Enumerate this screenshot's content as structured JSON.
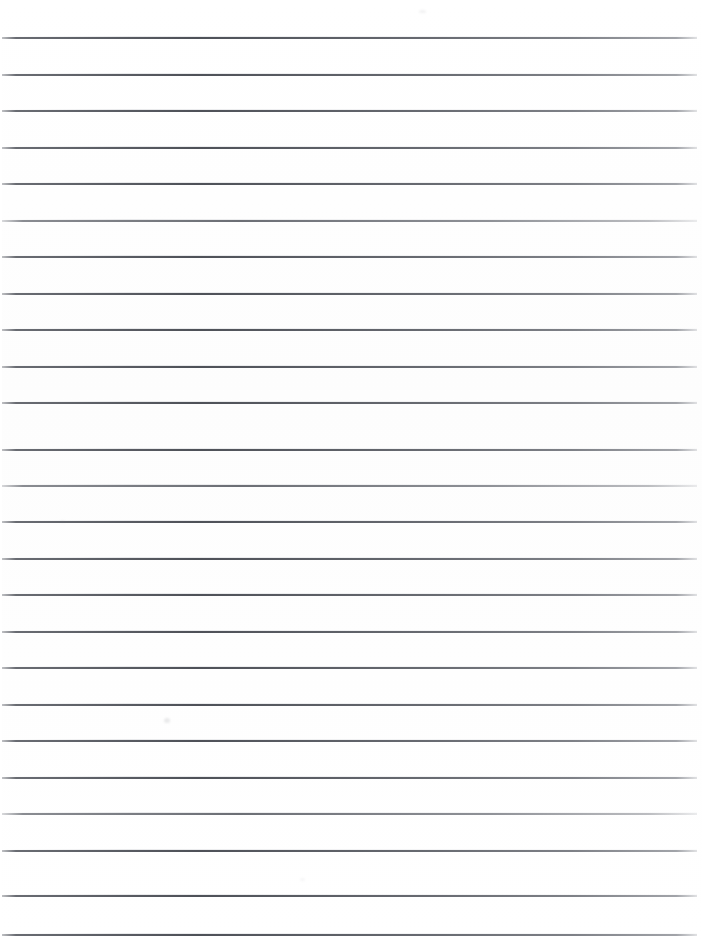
{
  "document": {
    "kind": "scanned-lined-paper",
    "title": "Blank lined notebook paper",
    "page_label": "",
    "body_text": "",
    "handwriting": "",
    "background_color": "#ffffff",
    "rule_color": "#4e5158",
    "width_px": 702,
    "height_px": 942
  },
  "ruling": {
    "line_count": 25,
    "first_line_y": 37,
    "spacing_px": 36.4,
    "line_left_x": 2,
    "line_right_x": 697,
    "line_thickness_px": 2,
    "lines": [
      {
        "index": 1,
        "y": 37,
        "left": 2,
        "right": 697,
        "weight": "normal"
      },
      {
        "index": 2,
        "y": 74,
        "left": 2,
        "right": 697,
        "weight": "normal"
      },
      {
        "index": 3,
        "y": 110,
        "left": 2,
        "right": 697,
        "weight": "normal"
      },
      {
        "index": 4,
        "y": 147,
        "left": 2,
        "right": 697,
        "weight": "normal"
      },
      {
        "index": 5,
        "y": 183,
        "left": 2,
        "right": 697,
        "weight": "normal"
      },
      {
        "index": 6,
        "y": 220,
        "left": 2,
        "right": 697,
        "weight": "faint"
      },
      {
        "index": 7,
        "y": 256,
        "left": 2,
        "right": 697,
        "weight": "normal"
      },
      {
        "index": 8,
        "y": 293,
        "left": 2,
        "right": 697,
        "weight": "normal"
      },
      {
        "index": 9,
        "y": 329,
        "left": 2,
        "right": 697,
        "weight": "normal"
      },
      {
        "index": 10,
        "y": 366,
        "left": 2,
        "right": 697,
        "weight": "normal"
      },
      {
        "index": 11,
        "y": 402,
        "left": 2,
        "right": 697,
        "weight": "normal"
      },
      {
        "index": 12,
        "y": 413,
        "left": 2,
        "right": 697,
        "weight": "skip"
      },
      {
        "index": 13,
        "y": 449,
        "left": 2,
        "right": 697,
        "weight": "normal"
      },
      {
        "index": 14,
        "y": 485,
        "left": 2,
        "right": 697,
        "weight": "faint"
      },
      {
        "index": 15,
        "y": 521,
        "left": 2,
        "right": 697,
        "weight": "normal"
      },
      {
        "index": 16,
        "y": 558,
        "left": 2,
        "right": 697,
        "weight": "normal"
      },
      {
        "index": 17,
        "y": 594,
        "left": 2,
        "right": 697,
        "weight": "normal"
      },
      {
        "index": 18,
        "y": 631,
        "left": 2,
        "right": 697,
        "weight": "normal"
      },
      {
        "index": 19,
        "y": 667,
        "left": 2,
        "right": 697,
        "weight": "normal"
      },
      {
        "index": 20,
        "y": 704,
        "left": 2,
        "right": 697,
        "weight": "normal"
      },
      {
        "index": 21,
        "y": 740,
        "left": 2,
        "right": 697,
        "weight": "normal"
      },
      {
        "index": 22,
        "y": 777,
        "left": 2,
        "right": 697,
        "weight": "normal"
      },
      {
        "index": 23,
        "y": 813,
        "left": 2,
        "right": 697,
        "weight": "faint"
      },
      {
        "index": 24,
        "y": 850,
        "left": 2,
        "right": 697,
        "weight": "normal"
      },
      {
        "index": 25,
        "y": 895,
        "left": 2,
        "right": 697,
        "weight": "normal"
      },
      {
        "index": 26,
        "y": 934,
        "left": 2,
        "right": 697,
        "weight": "normal"
      }
    ]
  },
  "artifacts": {
    "smudges": [
      {
        "name": "speck-top-right",
        "x": 419,
        "y": 10,
        "w": 7,
        "h": 3,
        "opacity": 0.1
      },
      {
        "name": "speck-mid-left",
        "x": 60,
        "y": 520,
        "w": 5,
        "h": 3,
        "opacity": 0.07
      },
      {
        "name": "speck-lower-mid",
        "x": 164,
        "y": 718,
        "w": 6,
        "h": 5,
        "opacity": 0.16
      },
      {
        "name": "speck-low-center",
        "x": 300,
        "y": 878,
        "w": 5,
        "h": 3,
        "opacity": 0.07
      }
    ]
  }
}
